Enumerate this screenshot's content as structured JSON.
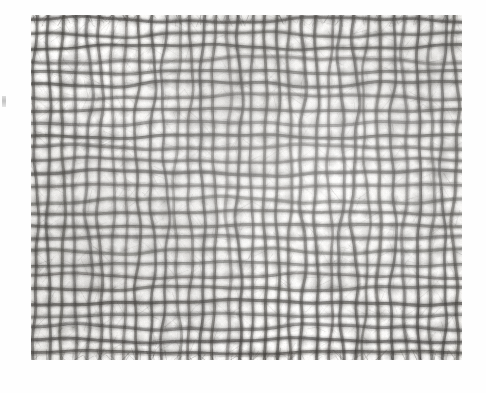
{
  "document": {
    "kind": "scanned-photograph",
    "subject": "woven mesh textile micrograph",
    "caption": "",
    "background_color": "#ffffff"
  },
  "plate": {
    "label": "woven-mesh-photograph",
    "left": 31,
    "top": 15,
    "width": 431,
    "height": 345,
    "base_color": "#f4f3f1",
    "thread_color": "#4a4845",
    "highlight_color": "#fbfaf8"
  },
  "weave": {
    "description": "plain-weave open gauze, frayed fibrous threads",
    "warp_count": 34,
    "weft_count": 27,
    "warp_period_px": 12.7,
    "weft_period_px": 12.8,
    "thread_width_px": 3.2,
    "waviness_px": 2.1,
    "fray_density": 0.55,
    "seed": 20240517
  },
  "artifacts": {
    "edge_mark_label": "scan-edge-mark",
    "edge_mark_left": 2,
    "edge_mark_top": 96,
    "edge_mark_width": 4,
    "edge_mark_height": 11
  }
}
